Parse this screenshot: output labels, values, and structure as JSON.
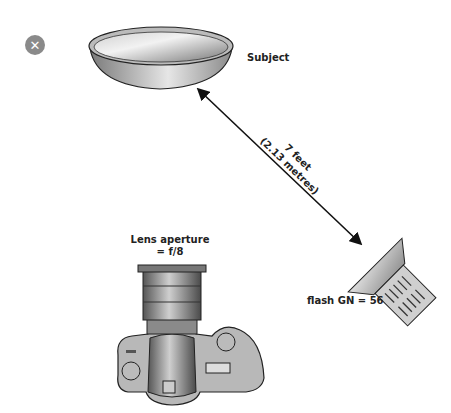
{
  "close_button": {
    "icon": "close-icon",
    "glyph": "✕"
  },
  "subject": {
    "label": "Subject"
  },
  "distance": {
    "line1": "7 feet",
    "line2": "(2.13 metres)"
  },
  "lens": {
    "line1": "Lens aperture",
    "line2_prefix": "= ",
    "value": "f/8"
  },
  "flash": {
    "label": "flash GN = 56"
  },
  "colors": {
    "close_bg": "#8a8a8a",
    "line": "#111111",
    "fill_gray": "#9a9a9a"
  }
}
